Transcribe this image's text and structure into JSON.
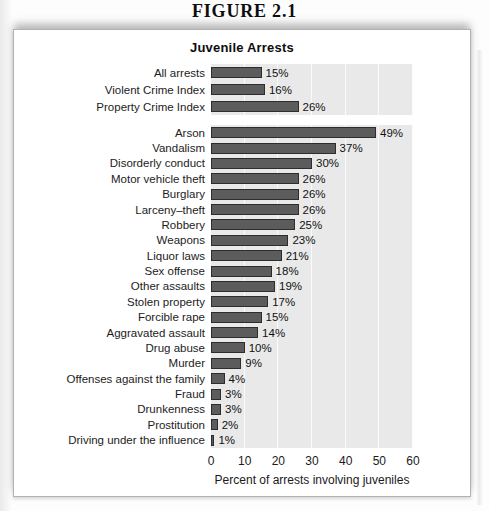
{
  "page": {
    "figure_label": "FIGURE 2.1"
  },
  "chart_data": {
    "type": "bar",
    "orientation": "horizontal",
    "title": "Juvenile Arrests",
    "xlabel": "Percent of arrests involving juveniles",
    "xlim": [
      0,
      60
    ],
    "xticks": [
      0,
      10,
      20,
      30,
      40,
      50,
      60
    ],
    "value_suffix": "%",
    "grid": "vertical-lines",
    "legend": "none",
    "groups": [
      {
        "name": "summary",
        "categories": [
          "All arrests",
          "Violent Crime Index",
          "Property Crime Index"
        ],
        "values": [
          15,
          16,
          26
        ]
      },
      {
        "name": "offenses",
        "categories": [
          "Arson",
          "Vandalism",
          "Disorderly conduct",
          "Motor vehicle theft",
          "Burglary",
          "Larceny–theft",
          "Robbery",
          "Weapons",
          "Liquor laws",
          "Sex offense",
          "Other assaults",
          "Stolen property",
          "Forcible rape",
          "Aggravated assault",
          "Drug abuse",
          "Murder",
          "Offenses against the family",
          "Fraud",
          "Drunkenness",
          "Prostitution",
          "Driving under the influence"
        ],
        "values": [
          49,
          37,
          30,
          26,
          26,
          26,
          25,
          23,
          21,
          18,
          19,
          17,
          15,
          14,
          10,
          9,
          4,
          3,
          3,
          2,
          1
        ]
      }
    ],
    "colors": {
      "bar_fill": "#5c5c5c",
      "bar_border": "#2d2d2d",
      "panel_bg": "#e9e9e9",
      "gridline": "#fbfbfb"
    }
  }
}
